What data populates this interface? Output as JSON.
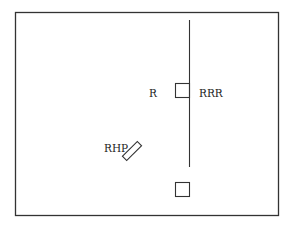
{
  "diagram": {
    "frame": {
      "x": 15.5,
      "y": 12.5,
      "width": 263,
      "height": 203,
      "stroke": "#333333"
    },
    "vertical_line": {
      "x": 189.5,
      "y1": 20,
      "y2": 167
    },
    "shapes": [
      {
        "id": "square-upper",
        "type": "square",
        "x": 175.5,
        "y": 83.5,
        "size": 14
      },
      {
        "id": "square-lower",
        "type": "square",
        "x": 175.5,
        "y": 182.5,
        "size": 14
      },
      {
        "id": "rhp-rect",
        "type": "rotated-rect",
        "cx": 132,
        "cy": 151,
        "w": 21,
        "h": 6,
        "angle": -45
      }
    ],
    "labels": {
      "r": "R",
      "rrr": "RRR",
      "rhp": "RHP"
    }
  }
}
